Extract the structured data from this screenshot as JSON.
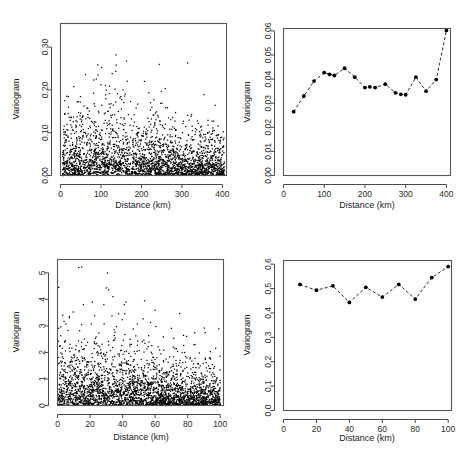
{
  "figure": {
    "panel_count": 4,
    "background_color": "#ffffff",
    "point_color": "#000000",
    "axis_color": "#4a4a4a"
  },
  "panels": [
    {
      "id": "panel-tl",
      "position": "top-left",
      "xlabel": "Distance (km)",
      "ylabel": "Variogram",
      "xticks": [
        "0",
        "100",
        "200",
        "300",
        "400"
      ],
      "yticks": [
        "0.00",
        "0.10",
        "0.20",
        "0.30"
      ]
    },
    {
      "id": "panel-tr",
      "position": "top-right",
      "xlabel": "Distance (km)",
      "ylabel": "Variogram",
      "xticks": [
        "0",
        "100",
        "200",
        "300",
        "400"
      ],
      "yticks": [
        "0.00",
        "0.01",
        "0.02",
        "0.03",
        "0.04",
        "0.05",
        "0.06"
      ]
    },
    {
      "id": "panel-bl",
      "position": "bottom-left",
      "xlabel": "Distance (km)",
      "ylabel": "Variogram",
      "xticks": [
        "0",
        "20",
        "40",
        "60",
        "80",
        "100"
      ],
      "yticks": [
        "0",
        "1",
        "2",
        "3",
        "4",
        "5"
      ]
    },
    {
      "id": "panel-br",
      "position": "bottom-right",
      "xlabel": "Distance (km)",
      "ylabel": "Variogram",
      "xticks": [
        "0",
        "20",
        "40",
        "60",
        "80",
        "100"
      ],
      "yticks": [
        "0.0",
        "0.1",
        "0.2",
        "0.3",
        "0.4",
        "0.5",
        "0.6"
      ]
    }
  ],
  "chart_data": [
    {
      "type": "scatter",
      "panel": "top-left",
      "title": "",
      "xlabel": "Distance (km)",
      "ylabel": "Variogram",
      "xlim": [
        0,
        410
      ],
      "ylim": [
        0.0,
        0.355
      ],
      "xticks": [
        0,
        100,
        200,
        300,
        400
      ],
      "yticks": [
        0.0,
        0.1,
        0.2,
        0.3
      ],
      "grid": false,
      "legend": "none",
      "n_points": 2600,
      "description": "Variogram cloud: dense black point cloud concentrated near 0.00, thinning upward; scattered outliers up to ~0.35 mostly between 60 and 170 km.",
      "density_profile": {
        "mode": "exponential-decay",
        "decay_scale": 0.055,
        "max_value": 0.355,
        "x_spread": [
          5,
          405
        ]
      }
    },
    {
      "type": "line",
      "panel": "top-right",
      "title": "",
      "xlabel": "Distance (km)",
      "ylabel": "Variogram",
      "xlim": [
        0,
        410
      ],
      "ylim": [
        0.0,
        0.061
      ],
      "xticks": [
        0,
        100,
        200,
        300,
        400
      ],
      "yticks": [
        0.0,
        0.01,
        0.02,
        0.03,
        0.04,
        0.05,
        0.06
      ],
      "grid": false,
      "legend": "none",
      "linestyle": "dashed",
      "marker": "filled-circle",
      "x": [
        25,
        50,
        75,
        100,
        113,
        125,
        150,
        175,
        200,
        212,
        225,
        250,
        275,
        288,
        300,
        325,
        350,
        375,
        400
      ],
      "values": [
        0.0265,
        0.033,
        0.0392,
        0.0427,
        0.042,
        0.0415,
        0.0445,
        0.0408,
        0.0365,
        0.0368,
        0.0365,
        0.0379,
        0.0343,
        0.0337,
        0.0335,
        0.0408,
        0.035,
        0.0398,
        0.0602
      ]
    },
    {
      "type": "scatter",
      "panel": "bottom-left",
      "title": "",
      "xlabel": "Distance (km)",
      "ylabel": "Variogram",
      "xlim": [
        0,
        102
      ],
      "ylim": [
        0.0,
        5.5
      ],
      "xticks": [
        0,
        20,
        40,
        60,
        80,
        100
      ],
      "yticks": [
        0,
        1,
        2,
        3,
        4,
        5
      ],
      "grid": false,
      "legend": "none",
      "n_points": 2800,
      "description": "Variogram cloud: dense black band below 1.0 across all distances, with sparse outliers up to ~5.4; the high-value scatter is densest between 5 and 60 km.",
      "density_profile": {
        "mode": "exponential-decay",
        "decay_scale": 0.85,
        "max_value": 5.45,
        "x_spread": [
          0.5,
          100
        ]
      }
    },
    {
      "type": "line",
      "panel": "bottom-right",
      "title": "",
      "xlabel": "Distance (km)",
      "ylabel": "Variogram",
      "xlim": [
        0,
        102
      ],
      "ylim": [
        0.0,
        0.615
      ],
      "xticks": [
        0,
        20,
        40,
        60,
        80,
        100
      ],
      "yticks": [
        0.0,
        0.1,
        0.2,
        0.3,
        0.4,
        0.5,
        0.6
      ],
      "grid": false,
      "legend": "none",
      "linestyle": "dashed",
      "marker": "filled-circle",
      "x": [
        10,
        20,
        30,
        40,
        50,
        60,
        70,
        80,
        90,
        100
      ],
      "values": [
        0.517,
        0.493,
        0.511,
        0.443,
        0.505,
        0.465,
        0.517,
        0.457,
        0.545,
        0.59
      ]
    }
  ]
}
